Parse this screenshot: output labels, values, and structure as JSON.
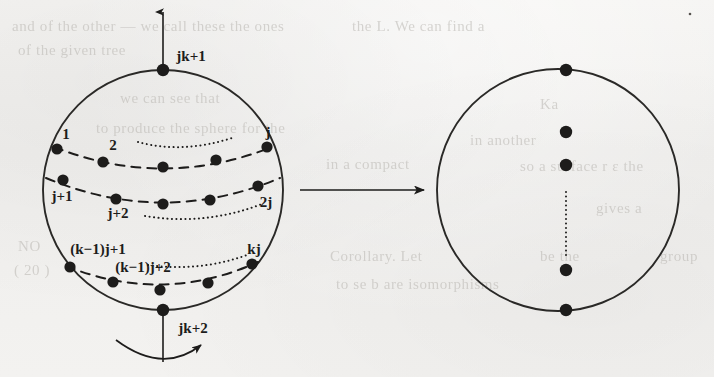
{
  "figure": {
    "colors": {
      "ink": "#1d1c1b",
      "paper": "#f2f1ef",
      "bleed_text": "#b9b6b1"
    },
    "left_circle": {
      "name": "source-sphere",
      "cx": 163,
      "cy": 190,
      "r": 120,
      "pole_labels": {
        "top": "jk+1",
        "bottom": "jk+2"
      },
      "rows": [
        {
          "name": "row-1",
          "first_label": "1",
          "second_label": "2",
          "last_label": "j",
          "dot_count": 5
        },
        {
          "name": "row-2",
          "first_label": "j+1",
          "second_label": "j+2",
          "last_label": "2j",
          "dot_count": 5
        },
        {
          "name": "row-k",
          "first_label": "(k−1)j+1",
          "second_label": "(k−1)j+2",
          "last_label": "kj",
          "dot_count": 5
        }
      ]
    },
    "map_arrow": {
      "name": "maps-to-arrow",
      "x1": 300,
      "x2": 424,
      "y": 190
    },
    "right_circle": {
      "name": "target-circle",
      "cx": 558,
      "cy": 190,
      "r": 121,
      "dot_y_positions": [
        70,
        132,
        165,
        270,
        310
      ],
      "ellipsis": "vertical-dotted"
    },
    "rotation_arrow": {
      "name": "rotation-arrow",
      "description": "curved arrow around vertical axis at bottom pole"
    },
    "axis_arrow": {
      "name": "axis-arrow",
      "description": "vertical axis through poles, arrowhead up"
    }
  },
  "bleed_text": [
    {
      "text": "and of the other — we call these the ones",
      "x": 12,
      "y": 18,
      "size": 15
    },
    {
      "text": "of the given tree",
      "x": 18,
      "y": 42,
      "size": 15
    },
    {
      "text": "we can see that",
      "x": 120,
      "y": 90,
      "size": 15
    },
    {
      "text": "to produce the sphere for the",
      "x": 96,
      "y": 120,
      "size": 15
    },
    {
      "text": "NO",
      "x": 18,
      "y": 238,
      "size": 15
    },
    {
      "text": "( 20 )",
      "x": 14,
      "y": 262,
      "size": 15
    },
    {
      "text": "the L. We can find a",
      "x": 352,
      "y": 18,
      "size": 15
    },
    {
      "text": "Ka",
      "x": 540,
      "y": 96,
      "size": 15
    },
    {
      "text": "in another",
      "x": 470,
      "y": 132,
      "size": 15
    },
    {
      "text": "in a compact",
      "x": 326,
      "y": 156,
      "size": 15
    },
    {
      "text": "so a surface r ε the",
      "x": 520,
      "y": 158,
      "size": 15
    },
    {
      "text": "gives a",
      "x": 596,
      "y": 200,
      "size": 15
    },
    {
      "text": "Corollary. Let",
      "x": 330,
      "y": 248,
      "size": 15
    },
    {
      "text": "be the",
      "x": 540,
      "y": 248,
      "size": 15
    },
    {
      "text": "group",
      "x": 660,
      "y": 248,
      "size": 15
    },
    {
      "text": "to se b are isomorphisms",
      "x": 336,
      "y": 276,
      "size": 15
    }
  ]
}
